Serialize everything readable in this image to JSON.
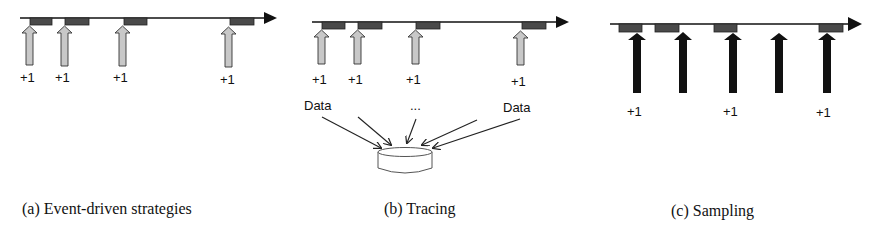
{
  "colors": {
    "axis": "#111111",
    "event_box": "#4a4a4a",
    "gray_arrow": "#c8c8c8",
    "black_arrow": "#111111"
  },
  "panels": [
    {
      "id": "a",
      "caption": "(a) Event-driven strategies",
      "increment_labels": [
        "+1",
        "+1",
        "+1",
        "+1"
      ]
    },
    {
      "id": "b",
      "caption": "(b) Tracing",
      "increment_labels": [
        "+1",
        "+1",
        "+1",
        "+1"
      ],
      "data_label_left": "Data",
      "data_label_right": "Data",
      "ellipsis": "...",
      "storage_icon": "database-cylinder-icon"
    },
    {
      "id": "c",
      "caption": "(c) Sampling",
      "increment_labels": [
        "+1",
        "+1",
        "+1"
      ]
    }
  ]
}
